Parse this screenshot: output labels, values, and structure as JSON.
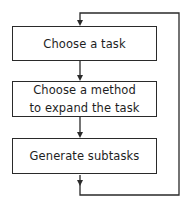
{
  "diagram": {
    "type": "flowchart",
    "steps": [
      {
        "id": "choose-task",
        "lines": [
          "Choose a task"
        ]
      },
      {
        "id": "choose-method",
        "lines": [
          "Choose a method",
          "to expand the task"
        ]
      },
      {
        "id": "generate-subtasks",
        "lines": [
          "Generate subtasks"
        ]
      }
    ],
    "edges": [
      {
        "from": "choose-task",
        "to": "choose-method"
      },
      {
        "from": "choose-method",
        "to": "generate-subtasks"
      },
      {
        "from": "generate-subtasks",
        "to": "choose-task",
        "kind": "loop-back"
      }
    ],
    "colors": {
      "stroke": "#2a2a2a",
      "text": "#1e1e1e",
      "background": "#ffffff"
    }
  }
}
